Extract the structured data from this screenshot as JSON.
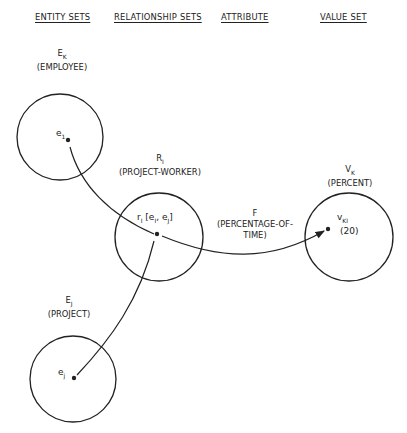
{
  "headers": {
    "entity_sets": "ENTITY SETS",
    "relationship_sets": "RELATIONSHIP SETS",
    "attribute": "ATTRIBUTE",
    "value_set": "VALUE SET"
  },
  "employee_set": {
    "symbol": "E",
    "subscript": "K",
    "name": "(EMPLOYEE)",
    "element": "e",
    "element_sub": "1"
  },
  "project_worker_set": {
    "symbol": "R",
    "subscript": "I",
    "name": "(PROJECT-WORKER)",
    "element": "r",
    "element_sub": "I",
    "element_args": "[e",
    "arg1_sub": "I",
    "arg_sep": ", e",
    "arg2_sub": "J",
    "close": "]"
  },
  "project_set": {
    "symbol": "E",
    "subscript": "J",
    "name": "(PROJECT)",
    "element": "e",
    "element_sub": "j"
  },
  "attribute": {
    "symbol": "F",
    "name_line1": "(PERCENTAGE-OF-",
    "name_line2": "TIME)"
  },
  "percent_set": {
    "symbol": "V",
    "subscript": "K",
    "name": "(PERCENT)",
    "element": "v",
    "element_sub": "KI",
    "value": "(20)"
  },
  "colors": {
    "ink": "#222222",
    "background": "#ffffff"
  }
}
